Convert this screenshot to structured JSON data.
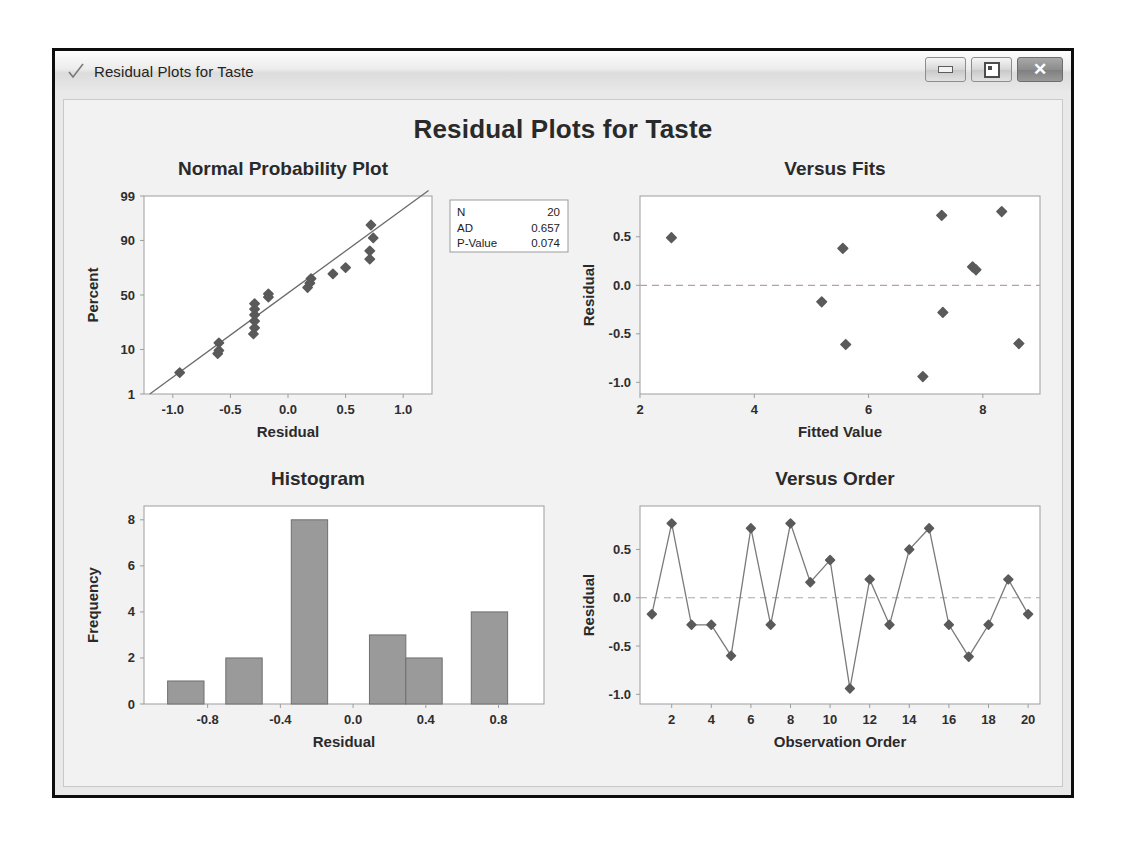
{
  "window": {
    "title": "Residual Plots for Taste",
    "icon": "checkmark-icon",
    "buttons": {
      "minimize": "minimize-icon",
      "maximize": "restore-icon",
      "close": "close-icon"
    }
  },
  "page": {
    "main_title": "Residual Plots for Taste",
    "background": "#f2f2f2",
    "marker_color": "#5a5a5a",
    "bar_fill": "#9a9a9a",
    "bar_stroke": "#6f6f6f",
    "axis_color": "#9d9d9d",
    "reference_line_color": "#b9a0a0"
  },
  "chart_data": [
    {
      "type": "scatter",
      "id": "normal-probability-plot",
      "title": "Normal Probability Plot",
      "xlabel": "Residual",
      "ylabel": "Percent",
      "xlim": [
        -1.25,
        1.25
      ],
      "ylim_percent": [
        1,
        99
      ],
      "xticks": [
        -1.0,
        -0.5,
        0.0,
        0.5,
        1.0
      ],
      "xticklabels": [
        "-1.0",
        "-0.5",
        "0.0",
        "0.5",
        "1.0"
      ],
      "yticks": [
        1,
        10,
        50,
        90,
        99
      ],
      "yticklabels": [
        "1",
        "10",
        "50",
        "90",
        "99"
      ],
      "grid": false,
      "fit_line": {
        "x": [
          -1.2,
          1.22
        ],
        "percent": [
          1.0,
          99.3
        ]
      },
      "points": [
        {
          "x": -0.94,
          "percent": 3.4
        },
        {
          "x": -0.61,
          "percent": 8.4
        },
        {
          "x": -0.6,
          "percent": 9.6
        },
        {
          "x": -0.6,
          "percent": 13.0
        },
        {
          "x": -0.3,
          "percent": 18.0
        },
        {
          "x": -0.29,
          "percent": 22.0
        },
        {
          "x": -0.29,
          "percent": 27.0
        },
        {
          "x": -0.29,
          "percent": 32.0
        },
        {
          "x": -0.29,
          "percent": 37.0
        },
        {
          "x": -0.29,
          "percent": 42.0
        },
        {
          "x": -0.17,
          "percent": 48.0
        },
        {
          "x": -0.17,
          "percent": 51.0
        },
        {
          "x": 0.17,
          "percent": 57.0
        },
        {
          "x": 0.19,
          "percent": 61.0
        },
        {
          "x": 0.2,
          "percent": 65.0
        },
        {
          "x": 0.39,
          "percent": 69.0
        },
        {
          "x": 0.5,
          "percent": 74.0
        },
        {
          "x": 0.71,
          "percent": 80.0
        },
        {
          "x": 0.71,
          "percent": 85.0
        },
        {
          "x": 0.74,
          "percent": 91.0
        },
        {
          "x": 0.72,
          "percent": 95.0
        }
      ],
      "legend": {
        "position": "right",
        "rows": [
          {
            "label": "N",
            "value": "20"
          },
          {
            "label": "AD",
            "value": "0.657"
          },
          {
            "label": "P-Value",
            "value": "0.074"
          }
        ]
      }
    },
    {
      "type": "scatter",
      "id": "versus-fits",
      "title": "Versus Fits",
      "xlabel": "Fitted Value",
      "ylabel": "Residual",
      "xlim": [
        2.0,
        9.0
      ],
      "ylim": [
        -1.12,
        0.92
      ],
      "xticks": [
        2,
        4,
        6,
        8
      ],
      "xticklabels": [
        "2",
        "4",
        "6",
        "8"
      ],
      "yticks": [
        -1.0,
        -0.5,
        0.0,
        0.5
      ],
      "yticklabels": [
        "-1.0",
        "-0.5",
        "0.0",
        "0.5"
      ],
      "grid": false,
      "reference_line_y": 0.0,
      "points": [
        {
          "x": 2.55,
          "y": 0.49
        },
        {
          "x": 5.18,
          "y": -0.17
        },
        {
          "x": 5.55,
          "y": 0.38
        },
        {
          "x": 5.6,
          "y": -0.61
        },
        {
          "x": 6.95,
          "y": -0.94
        },
        {
          "x": 7.28,
          "y": 0.72
        },
        {
          "x": 7.3,
          "y": -0.28
        },
        {
          "x": 7.82,
          "y": 0.19
        },
        {
          "x": 7.88,
          "y": 0.16
        },
        {
          "x": 8.33,
          "y": 0.76
        },
        {
          "x": 8.63,
          "y": -0.6
        }
      ]
    },
    {
      "type": "bar",
      "id": "histogram",
      "title": "Histogram",
      "xlabel": "Residual",
      "ylabel": "Frequency",
      "xlim": [
        -1.15,
        1.05
      ],
      "ylim": [
        0,
        8.6
      ],
      "xticks": [
        -0.8,
        -0.4,
        0.0,
        0.4,
        0.8
      ],
      "xticklabels": [
        "-0.8",
        "-0.4",
        "0.0",
        "0.4",
        "0.8"
      ],
      "yticks": [
        0,
        2,
        4,
        6,
        8
      ],
      "yticklabels": [
        "0",
        "2",
        "4",
        "6",
        "8"
      ],
      "grid": false,
      "bin_width": 0.2,
      "bins": [
        {
          "left": -1.02,
          "right": -0.82,
          "count": 1
        },
        {
          "left": -0.7,
          "right": -0.5,
          "count": 2
        },
        {
          "left": -0.34,
          "right": -0.14,
          "count": 8
        },
        {
          "left": 0.09,
          "right": 0.29,
          "count": 3
        },
        {
          "left": 0.29,
          "right": 0.49,
          "count": 2
        },
        {
          "left": 0.65,
          "right": 0.85,
          "count": 4
        }
      ]
    },
    {
      "type": "line",
      "id": "versus-order",
      "title": "Versus Order",
      "xlabel": "Observation Order",
      "ylabel": "Residual",
      "xlim": [
        0.4,
        20.6
      ],
      "ylim": [
        -1.1,
        0.95
      ],
      "xticks": [
        2,
        4,
        6,
        8,
        10,
        12,
        14,
        16,
        18,
        20
      ],
      "xticklabels": [
        "2",
        "4",
        "6",
        "8",
        "10",
        "12",
        "14",
        "16",
        "18",
        "20"
      ],
      "yticks": [
        -1.0,
        -0.5,
        0.0,
        0.5
      ],
      "yticklabels": [
        "-1.0",
        "-0.5",
        "0.0",
        "0.5"
      ],
      "grid": false,
      "reference_line_y": 0.0,
      "x": [
        1,
        2,
        3,
        4,
        5,
        6,
        7,
        8,
        9,
        10,
        11,
        12,
        13,
        14,
        15,
        16,
        17,
        18,
        19,
        20
      ],
      "values": [
        -0.17,
        0.77,
        -0.28,
        -0.28,
        -0.6,
        0.72,
        -0.28,
        0.77,
        0.16,
        0.39,
        -0.94,
        0.19,
        -0.28,
        0.5,
        0.72,
        -0.28,
        -0.61,
        -0.28,
        0.19,
        -0.17
      ]
    }
  ]
}
